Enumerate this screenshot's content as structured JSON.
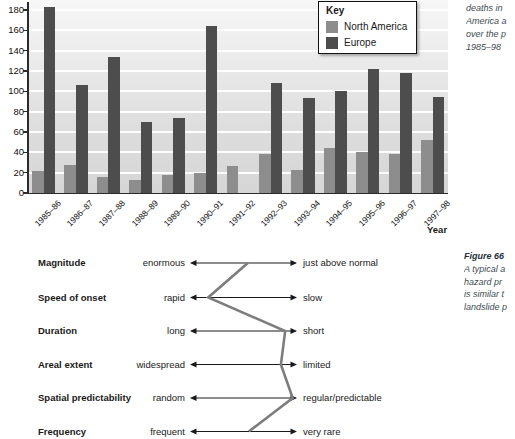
{
  "chart_caption": {
    "lines": [
      "deaths in",
      "America a",
      "over the p",
      "1985–98"
    ]
  },
  "chart_data": [
    {
      "type": "bar",
      "title": "",
      "categories": [
        "1985–86",
        "1986–87",
        "1987–88",
        "1988–89",
        "1989–90",
        "1990–91",
        "1991–92",
        "1992–93",
        "1993–94",
        "1994–95",
        "1995–96",
        "1996–97",
        "1997–98"
      ],
      "series": [
        {
          "name": "North America",
          "color": "#8d8d8d",
          "values": [
            22,
            28,
            16,
            13,
            18,
            20,
            27,
            38,
            23,
            44,
            40,
            38,
            52
          ]
        },
        {
          "name": "Europe",
          "color": "#4d4d4d",
          "values": [
            183,
            106,
            134,
            70,
            74,
            164,
            0,
            108,
            93,
            100,
            122,
            118,
            94
          ]
        }
      ],
      "xlabel": "Year",
      "ylabel": "",
      "ylim": [
        0,
        180
      ],
      "ytick_step": 20,
      "grid": true,
      "legend_title": "Key",
      "legend_position": "top-right"
    },
    {
      "type": "line",
      "title": "",
      "subtitle": "bipolar hazard profile",
      "rows": [
        {
          "label": "Magnitude",
          "left": "enormous",
          "right": "just above normal",
          "position": 0.54
        },
        {
          "label": "Speed of onset",
          "left": "rapid",
          "right": "slow",
          "position": 0.17
        },
        {
          "label": "Duration",
          "left": "long",
          "right": "short",
          "position": 0.89
        },
        {
          "label": "Areal extent",
          "left": "widespread",
          "right": "limited",
          "position": 0.85
        },
        {
          "label": "Spatial predictability",
          "left": "random",
          "right": "regular/predictable",
          "position": 0.96
        },
        {
          "label": "Frequency",
          "left": "frequent",
          "right": "very rare",
          "position": 0.55
        }
      ],
      "line_color": "#7d7d7d",
      "axis_note": "position: 0 = left pole, 1 = right pole"
    }
  ],
  "figure_caption": {
    "title": "Figure 66",
    "lines": [
      "A typical a",
      "hazard pr",
      "is similar t",
      "landslide p"
    ]
  },
  "colors": {
    "bar_north_america": "#8d8d8d",
    "bar_europe": "#4d4d4d",
    "axis": "#2b2b2b",
    "caption_text": "#3d4b52",
    "profile_line": "#7d7d7d"
  }
}
